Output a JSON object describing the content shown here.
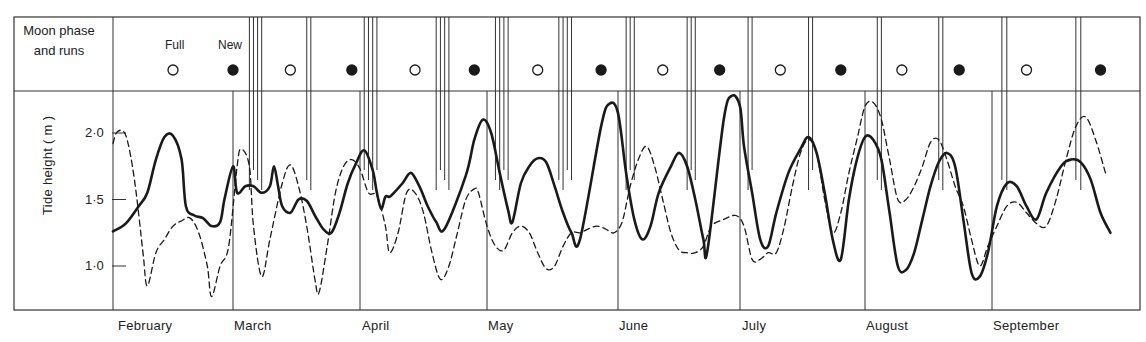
{
  "upper_panel": {
    "row_label_line1": "Moon phase",
    "row_label_line2": "and runs",
    "full_label": "Full",
    "new_label": "New"
  },
  "y_axis": {
    "label": "Tide height  ( m )",
    "ticks": [
      "2·0",
      "1·5",
      "1·0"
    ]
  },
  "months": [
    "February",
    "March",
    "April",
    "May",
    "June",
    "July",
    "August",
    "September"
  ],
  "colors": {
    "line": "#1a1a1a",
    "frame": "#333333",
    "background": "#ffffff"
  },
  "chart_data": {
    "type": "line",
    "title": "",
    "xlabel": "",
    "ylabel": "Tide height (m)",
    "ylim": [
      0.68,
      2.35
    ],
    "yticks": [
      1.0,
      1.5,
      2.0
    ],
    "grid": false,
    "x_units": "day offset from 1 February",
    "x_month_starts": {
      "February": 0,
      "March": 28,
      "April": 59,
      "May": 89,
      "June": 120,
      "July": 150,
      "August": 181,
      "September": 212
    },
    "moon_phases": [
      {
        "phase": "Full",
        "day": 14
      },
      {
        "phase": "New",
        "day": 28
      },
      {
        "phase": "Full",
        "day": 42
      },
      {
        "phase": "New",
        "day": 57
      },
      {
        "phase": "Full",
        "day": 72
      },
      {
        "phase": "New",
        "day": 86
      },
      {
        "phase": "Full",
        "day": 101
      },
      {
        "phase": "New",
        "day": 116
      },
      {
        "phase": "Full",
        "day": 131
      },
      {
        "phase": "New",
        "day": 145
      },
      {
        "phase": "Full",
        "day": 160
      },
      {
        "phase": "New",
        "day": 175
      },
      {
        "phase": "Full",
        "day": 190
      },
      {
        "phase": "New",
        "day": 204
      },
      {
        "phase": "Full",
        "day": 219
      },
      {
        "phase": "New",
        "day": 234
      }
    ],
    "fish_run_days": [
      32,
      33,
      34,
      35,
      46,
      47,
      60,
      61,
      62,
      63,
      77,
      78,
      79,
      80,
      91,
      92,
      93,
      94,
      106,
      107,
      108,
      109,
      122,
      123,
      124,
      137,
      138,
      139,
      152,
      153,
      167,
      168,
      184,
      185,
      199,
      200,
      214,
      215,
      229,
      230
    ],
    "series": [
      {
        "name": "Daytime high tide",
        "style": "solid",
        "points": [
          [
            0,
            1.26
          ],
          [
            3,
            1.32
          ],
          [
            6,
            1.45
          ],
          [
            8,
            1.55
          ],
          [
            10,
            1.8
          ],
          [
            12,
            1.97
          ],
          [
            14,
            1.98
          ],
          [
            16,
            1.8
          ],
          [
            17,
            1.45
          ],
          [
            19,
            1.38
          ],
          [
            21,
            1.36
          ],
          [
            23,
            1.3
          ],
          [
            25,
            1.33
          ],
          [
            26,
            1.5
          ],
          [
            28,
            1.75
          ],
          [
            29,
            1.55
          ],
          [
            31,
            1.6
          ],
          [
            33,
            1.6
          ],
          [
            35,
            1.55
          ],
          [
            37,
            1.6
          ],
          [
            38,
            1.75
          ],
          [
            39,
            1.6
          ],
          [
            40,
            1.45
          ],
          [
            42,
            1.4
          ],
          [
            44,
            1.5
          ],
          [
            46,
            1.49
          ],
          [
            48,
            1.38
          ],
          [
            50,
            1.28
          ],
          [
            52,
            1.25
          ],
          [
            54,
            1.4
          ],
          [
            56,
            1.62
          ],
          [
            58,
            1.77
          ],
          [
            60,
            1.87
          ],
          [
            62,
            1.72
          ],
          [
            63,
            1.55
          ],
          [
            64,
            1.43
          ],
          [
            65,
            1.52
          ],
          [
            66,
            1.52
          ],
          [
            67,
            1.55
          ],
          [
            69,
            1.62
          ],
          [
            71,
            1.7
          ],
          [
            73,
            1.6
          ],
          [
            75,
            1.45
          ],
          [
            77,
            1.33
          ],
          [
            79,
            1.28
          ],
          [
            84,
            1.68
          ],
          [
            86,
            1.95
          ],
          [
            88,
            2.1
          ],
          [
            90,
            2.0
          ],
          [
            92,
            1.7
          ],
          [
            94,
            1.42
          ],
          [
            95,
            1.33
          ],
          [
            97,
            1.62
          ],
          [
            99,
            1.75
          ],
          [
            101,
            1.81
          ],
          [
            103,
            1.78
          ],
          [
            105,
            1.6
          ],
          [
            107,
            1.4
          ],
          [
            109,
            1.25
          ],
          [
            111,
            1.2
          ],
          [
            116,
            2.05
          ],
          [
            118,
            2.22
          ],
          [
            120,
            2.15
          ],
          [
            122,
            1.7
          ],
          [
            124,
            1.35
          ],
          [
            126,
            1.2
          ],
          [
            128,
            1.3
          ],
          [
            130,
            1.55
          ],
          [
            133,
            1.75
          ],
          [
            135,
            1.85
          ],
          [
            137,
            1.75
          ],
          [
            139,
            1.5
          ],
          [
            141,
            1.2
          ],
          [
            142,
            1.12
          ],
          [
            146,
            2.1
          ],
          [
            148,
            2.28
          ],
          [
            150,
            2.2
          ],
          [
            151,
            1.9
          ],
          [
            153,
            1.55
          ],
          [
            155,
            1.2
          ],
          [
            157,
            1.15
          ],
          [
            159,
            1.4
          ],
          [
            162,
            1.7
          ],
          [
            165,
            1.88
          ],
          [
            167,
            1.97
          ],
          [
            169,
            1.85
          ],
          [
            171,
            1.55
          ],
          [
            173,
            1.2
          ],
          [
            175,
            1.05
          ],
          [
            177,
            1.5
          ],
          [
            179,
            1.8
          ],
          [
            181,
            1.97
          ],
          [
            183,
            1.95
          ],
          [
            185,
            1.8
          ],
          [
            187,
            1.4
          ],
          [
            189,
            1.0
          ],
          [
            191,
            0.97
          ],
          [
            193,
            1.1
          ],
          [
            195,
            1.35
          ],
          [
            197,
            1.6
          ],
          [
            199,
            1.78
          ],
          [
            201,
            1.85
          ],
          [
            203,
            1.75
          ],
          [
            205,
            1.35
          ],
          [
            207,
            0.95
          ],
          [
            209,
            0.92
          ],
          [
            211,
            1.1
          ],
          [
            213,
            1.45
          ],
          [
            215,
            1.62
          ],
          [
            217,
            1.6
          ],
          [
            219,
            1.45
          ],
          [
            221,
            1.35
          ],
          [
            223,
            1.55
          ],
          [
            226,
            1.75
          ],
          [
            228,
            1.8
          ],
          [
            230,
            1.78
          ],
          [
            232,
            1.65
          ],
          [
            234,
            1.4
          ],
          [
            236,
            1.25
          ]
        ]
      },
      {
        "name": "Nighttime high tide",
        "style": "dashed",
        "points": [
          [
            0,
            1.92
          ],
          [
            1,
            2.01
          ],
          [
            3,
            1.98
          ],
          [
            5,
            1.65
          ],
          [
            7,
            1.1
          ],
          [
            8,
            0.85
          ],
          [
            10,
            1.1
          ],
          [
            12,
            1.2
          ],
          [
            14,
            1.3
          ],
          [
            16,
            1.34
          ],
          [
            18,
            1.36
          ],
          [
            20,
            1.25
          ],
          [
            22,
            1.0
          ],
          [
            23,
            0.77
          ],
          [
            25,
            1.0
          ],
          [
            27,
            1.15
          ],
          [
            29,
            1.75
          ],
          [
            30,
            1.88
          ],
          [
            32,
            1.75
          ],
          [
            33,
            1.3
          ],
          [
            35,
            0.92
          ],
          [
            37,
            1.2
          ],
          [
            40,
            1.62
          ],
          [
            42,
            1.76
          ],
          [
            44,
            1.6
          ],
          [
            46,
            1.3
          ],
          [
            48,
            0.9
          ],
          [
            49,
            0.8
          ],
          [
            51,
            1.15
          ],
          [
            53,
            1.55
          ],
          [
            55,
            1.75
          ],
          [
            57,
            1.8
          ],
          [
            59,
            1.73
          ],
          [
            61,
            1.55
          ],
          [
            63,
            1.53
          ],
          [
            65,
            1.3
          ],
          [
            66,
            1.1
          ],
          [
            68,
            1.25
          ],
          [
            70,
            1.55
          ],
          [
            72,
            1.55
          ],
          [
            74,
            1.4
          ],
          [
            76,
            1.1
          ],
          [
            78,
            0.9
          ],
          [
            80,
            1.0
          ],
          [
            82,
            1.25
          ],
          [
            84,
            1.5
          ],
          [
            86,
            1.58
          ],
          [
            87,
            1.55
          ],
          [
            89,
            1.3
          ],
          [
            91,
            1.15
          ],
          [
            93,
            1.12
          ],
          [
            95,
            1.25
          ],
          [
            97,
            1.3
          ],
          [
            99,
            1.25
          ],
          [
            101,
            1.1
          ],
          [
            103,
            0.98
          ],
          [
            105,
            1.0
          ],
          [
            107,
            1.15
          ],
          [
            109,
            1.25
          ],
          [
            111,
            1.25
          ],
          [
            113,
            1.28
          ],
          [
            115,
            1.3
          ],
          [
            117,
            1.28
          ],
          [
            119,
            1.25
          ],
          [
            121,
            1.33
          ],
          [
            123,
            1.6
          ],
          [
            125,
            1.8
          ],
          [
            127,
            1.9
          ],
          [
            129,
            1.75
          ],
          [
            131,
            1.5
          ],
          [
            133,
            1.25
          ],
          [
            135,
            1.12
          ],
          [
            137,
            1.1
          ],
          [
            139,
            1.1
          ],
          [
            141,
            1.15
          ],
          [
            143,
            1.3
          ],
          [
            146,
            1.35
          ],
          [
            149,
            1.38
          ],
          [
            151,
            1.3
          ],
          [
            153,
            1.05
          ],
          [
            155,
            1.05
          ],
          [
            157,
            1.1
          ],
          [
            159,
            1.1
          ],
          [
            161,
            1.3
          ],
          [
            163,
            1.6
          ],
          [
            165,
            1.85
          ],
          [
            167,
            1.95
          ],
          [
            169,
            1.85
          ],
          [
            171,
            1.5
          ],
          [
            173,
            1.25
          ],
          [
            175,
            1.4
          ],
          [
            177,
            1.7
          ],
          [
            179,
            1.95
          ],
          [
            181,
            2.2
          ],
          [
            183,
            2.23
          ],
          [
            185,
            2.1
          ],
          [
            187,
            1.8
          ],
          [
            189,
            1.5
          ],
          [
            191,
            1.5
          ],
          [
            193,
            1.6
          ],
          [
            195,
            1.75
          ],
          [
            197,
            1.93
          ],
          [
            199,
            1.95
          ],
          [
            201,
            1.8
          ],
          [
            203,
            1.6
          ],
          [
            205,
            1.45
          ],
          [
            207,
            1.2
          ],
          [
            209,
            1.0
          ],
          [
            211,
            1.15
          ],
          [
            213,
            1.3
          ],
          [
            215,
            1.45
          ],
          [
            217,
            1.48
          ],
          [
            219,
            1.4
          ],
          [
            221,
            1.32
          ],
          [
            223,
            1.3
          ],
          [
            225,
            1.5
          ],
          [
            227,
            1.8
          ],
          [
            229,
            2.05
          ],
          [
            231,
            2.12
          ],
          [
            233,
            1.95
          ],
          [
            235,
            1.7
          ]
        ]
      }
    ]
  }
}
